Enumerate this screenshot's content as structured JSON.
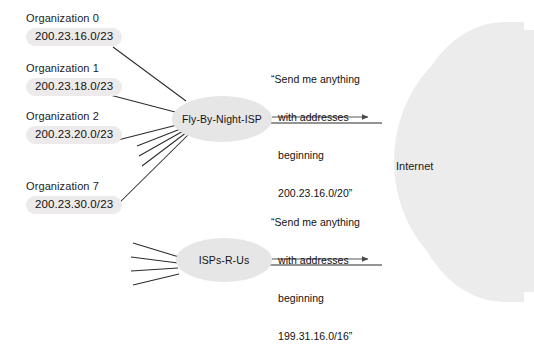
{
  "diagram": {
    "type": "network-topology",
    "organizations": [
      {
        "name": "Organization 0",
        "prefix": "200.23.16.0/23",
        "connects_to": "Fly-By-Night-ISP"
      },
      {
        "name": "Organization 1",
        "prefix": "200.23.18.0/23",
        "connects_to": "Fly-By-Night-ISP"
      },
      {
        "name": "Organization 2",
        "prefix": "200.23.20.0/23",
        "connects_to": "Fly-By-Night-ISP"
      },
      {
        "name": "Organization 7",
        "prefix": "200.23.30.0/23",
        "connects_to": "Fly-By-Night-ISP"
      }
    ],
    "providers": [
      {
        "id": "fly-by-night-isp",
        "label": "Fly-By-Night-ISP"
      },
      {
        "id": "isps-r-us",
        "label": "ISPs-R-Us"
      }
    ],
    "internet": {
      "label": "Internet"
    },
    "announcements": [
      {
        "from": "Fly-By-Night-ISP",
        "to": "Internet",
        "line1": "“Send me anything",
        "line2": "with addresses",
        "line3": "beginning",
        "line4": "200.23.16.0/20”",
        "aggregate_prefix": "200.23.16.0/20"
      },
      {
        "from": "ISPs-R-Us",
        "to": "Internet",
        "line1": "“Send me anything",
        "line2": "with addresses",
        "line3": "beginning",
        "line4": "199.31.16.0/16”",
        "aggregate_prefix": "199.31.16.0/16"
      }
    ],
    "colors": {
      "pill_fill": "#eceaea",
      "node_fill": "#e7e6e6",
      "cloud_fill": "#ececec",
      "line": "#2b2b2b",
      "text": "#1a1a1a"
    }
  }
}
